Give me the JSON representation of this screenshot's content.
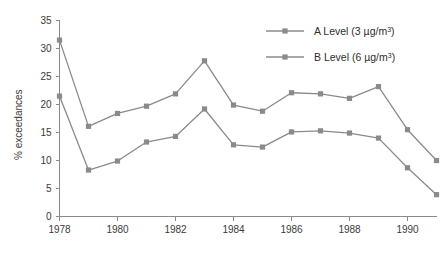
{
  "chart_data": {
    "type": "line",
    "title": "",
    "xlabel": "",
    "ylabel": "% exceedances",
    "xlim": [
      1978,
      1991
    ],
    "ylim": [
      0,
      35
    ],
    "ytick_step": 5,
    "grid": false,
    "legend_position": "top-right",
    "x": [
      1978,
      1979,
      1980,
      1981,
      1982,
      1983,
      1984,
      1985,
      1986,
      1987,
      1988,
      1989,
      1990,
      1991
    ],
    "xtick_labels": [
      "1978",
      "1980",
      "1982",
      "1984",
      "1986",
      "1988",
      "1990"
    ],
    "xtick_values": [
      1978,
      1980,
      1982,
      1984,
      1986,
      1988,
      1990
    ],
    "ytick_labels": [
      "0",
      "5",
      "10",
      "15",
      "20",
      "25",
      "30",
      "35"
    ],
    "ytick_values": [
      0,
      5,
      10,
      15,
      20,
      25,
      30,
      35
    ],
    "series": [
      {
        "name": "A Level (3 µg/m3)",
        "label_main": "A Level (3 µg/m",
        "label_sup": "3",
        "label_tail": ")",
        "marker": "square",
        "color": "#8a8a8a",
        "values": [
          31.5,
          16.1,
          18.4,
          19.7,
          21.9,
          27.8,
          19.9,
          18.8,
          22.1,
          21.9,
          21.1,
          23.2,
          15.5,
          10.0
        ]
      },
      {
        "name": "B Level (6 µg/m3)",
        "label_main": "B Level (6 µg/m",
        "label_sup": "3",
        "label_tail": ")",
        "marker": "square",
        "color": "#8a8a8a",
        "values": [
          21.5,
          8.3,
          9.9,
          13.3,
          14.3,
          19.2,
          12.8,
          12.4,
          15.1,
          15.3,
          14.9,
          14.0,
          8.7,
          3.9
        ]
      }
    ]
  },
  "colors": {
    "line": "#8a8a8a",
    "axis": "#8a8a8a",
    "text": "#3a3a3a",
    "background": "#ffffff"
  }
}
